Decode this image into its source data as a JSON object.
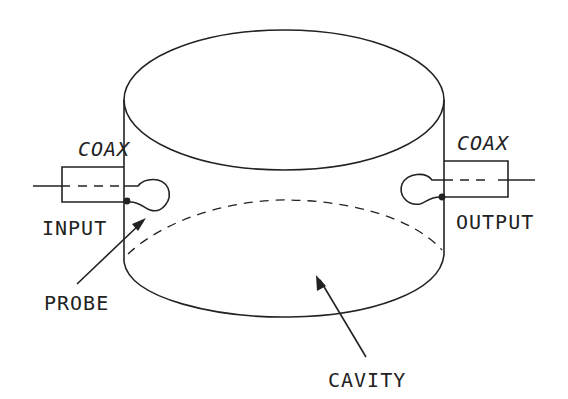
{
  "diagram": {
    "labels": {
      "coax_input": "COAX",
      "coax_output": "COAX",
      "input": "INPUT",
      "output": "OUTPUT",
      "probe": "PROBE",
      "cavity": "CAVITY"
    },
    "colors": {
      "stroke": "#222222",
      "background": "#ffffff"
    }
  }
}
